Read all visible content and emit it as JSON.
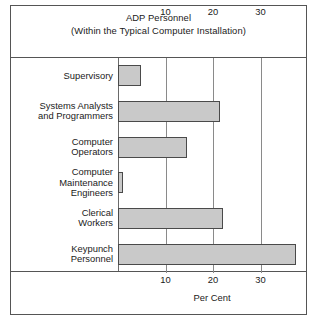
{
  "chart_data": {
    "type": "bar",
    "orientation": "horizontal",
    "title": "ADP Personnel",
    "subtitle": "(Within the Typical Computer Installation)",
    "xlabel": "Per Cent",
    "ylabel": "",
    "xlim": [
      0,
      40
    ],
    "xticks": [
      10,
      20,
      30
    ],
    "xtick_labels": [
      "10",
      "20",
      "30"
    ],
    "grid": true,
    "legend": "none",
    "top_axis": true,
    "bottom_axis": true,
    "categories": [
      "Supervisory",
      "Systems Analysts and Programmers",
      "Computer Operators",
      "Computer Maintenance Engineers",
      "Clerical Workers",
      "Keypunch Personnel"
    ],
    "values": [
      4.8,
      21.5,
      14.5,
      1,
      22,
      37.5
    ],
    "bar_fill": "#c9c9c9",
    "bar_border": "#4a4a4a",
    "frame_color": "#555555",
    "grid_color": "#8a8a8a",
    "background": "#ffffff"
  },
  "labels": {
    "rows": [
      {
        "lines": [
          "Supervisory"
        ]
      },
      {
        "lines": [
          "Systems Analysts",
          "and Programmers"
        ]
      },
      {
        "lines": [
          "Computer",
          "Operators"
        ]
      },
      {
        "lines": [
          "Computer",
          "Maintenance",
          "Engineers"
        ]
      },
      {
        "lines": [
          "Clerical",
          "Workers"
        ]
      },
      {
        "lines": [
          "Keypunch",
          "Personnel"
        ]
      }
    ]
  }
}
